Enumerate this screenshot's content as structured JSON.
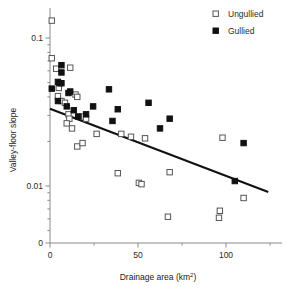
{
  "chart_data": {
    "type": "scatter",
    "title": "",
    "xlabel": "Drainage area  (km²)",
    "ylabel": "Valley-floor slope",
    "xlim": [
      0,
      125
    ],
    "ylim": [
      0.004,
      0.16
    ],
    "yscale": "log",
    "xscale": "linear",
    "grid": false,
    "legend_position": "top-right",
    "xticks": [
      0,
      50,
      100
    ],
    "xticklabels": [
      "0",
      "50",
      "100"
    ],
    "xticks_minor": [
      25,
      75,
      125
    ],
    "yticks": [
      0.1,
      0.01,
      0
    ],
    "yticklabels": [
      "0.1",
      "0.01",
      "0"
    ],
    "yticks_minor": [
      0.09,
      0.08,
      0.07,
      0.06,
      0.05,
      0.04,
      0.03,
      0.02,
      0.009,
      0.008,
      0.007,
      0.006,
      0.005
    ],
    "series": [
      {
        "name": "Ungullied",
        "marker": "open-square",
        "color": "#ffffff",
        "edge_color": "#555555",
        "points": [
          [
            1.0,
            0.131
          ],
          [
            1.0,
            0.073
          ],
          [
            3.5,
            0.062
          ],
          [
            11.5,
            0.063
          ],
          [
            5.0,
            0.046
          ],
          [
            4.5,
            0.0405
          ],
          [
            6.5,
            0.0375
          ],
          [
            8.5,
            0.0365
          ],
          [
            14.5,
            0.0415
          ],
          [
            15.5,
            0.04
          ],
          [
            10.5,
            0.0305
          ],
          [
            11.0,
            0.0285
          ],
          [
            9.5,
            0.0265
          ],
          [
            12.5,
            0.0245
          ],
          [
            19.5,
            0.0295
          ],
          [
            20.5,
            0.0285
          ],
          [
            26.5,
            0.0225
          ],
          [
            15.5,
            0.0185
          ],
          [
            18.5,
            0.0195
          ],
          [
            40.5,
            0.0225
          ],
          [
            46.0,
            0.0215
          ],
          [
            54.0,
            0.021
          ],
          [
            38.5,
            0.0122
          ],
          [
            50.5,
            0.0105
          ],
          [
            52.0,
            0.0103
          ],
          [
            68.0,
            0.0124
          ],
          [
            67.0,
            0.0062
          ],
          [
            96.5,
            0.0068
          ],
          [
            96.0,
            0.0061
          ],
          [
            98.0,
            0.0212
          ],
          [
            110.0,
            0.0083
          ]
        ]
      },
      {
        "name": "Gullied",
        "marker": "filled-square",
        "color": "#111111",
        "edge_color": "#111111",
        "points": [
          [
            6.5,
            0.0655
          ],
          [
            6.5,
            0.0585
          ],
          [
            1.0,
            0.0455
          ],
          [
            4.5,
            0.0505
          ],
          [
            5.5,
            0.0495
          ],
          [
            6.5,
            0.0495
          ],
          [
            10.5,
            0.0425
          ],
          [
            11.5,
            0.0435
          ],
          [
            9.5,
            0.0345
          ],
          [
            4.5,
            0.0375
          ],
          [
            13.5,
            0.0325
          ],
          [
            16.0,
            0.0295
          ],
          [
            20.5,
            0.0305
          ],
          [
            24.5,
            0.0345
          ],
          [
            33.5,
            0.045
          ],
          [
            38.5,
            0.033
          ],
          [
            35.5,
            0.0275
          ],
          [
            56.0,
            0.0365
          ],
          [
            62.5,
            0.0245
          ],
          [
            68.0,
            0.0285
          ],
          [
            105.0,
            0.0108
          ],
          [
            110.0,
            0.0195
          ]
        ]
      }
    ],
    "trendline": {
      "label": "regression",
      "x_start": 0,
      "y_start": 0.0333,
      "x_end": 124,
      "y_end": 0.0091,
      "color": "#111111"
    }
  },
  "legend": {
    "items": [
      {
        "label": "Ungullied",
        "marker": "open-square"
      },
      {
        "label": "Gullied",
        "marker": "filled-square"
      }
    ]
  },
  "axes": {
    "x_label": "Drainage area  (km²)",
    "y_label": "Valley-floor slope"
  }
}
